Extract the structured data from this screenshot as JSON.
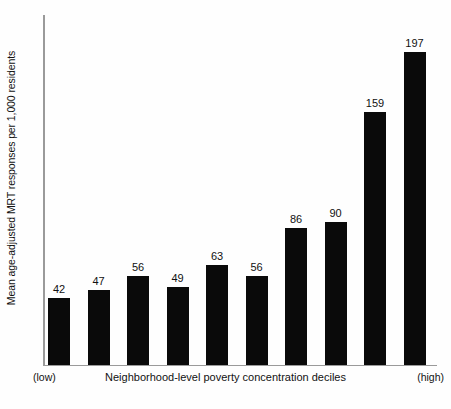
{
  "chart_data": {
    "type": "bar",
    "title": "",
    "subtitle": "",
    "categories": [
      "1",
      "2",
      "3",
      "4",
      "5",
      "6",
      "7",
      "8",
      "9",
      "10"
    ],
    "values": [
      42,
      47,
      56,
      49,
      63,
      56,
      86,
      90,
      159,
      197
    ],
    "data_labels": [
      "42",
      "47",
      "56",
      "49",
      "63",
      "56",
      "86",
      "90",
      "159",
      "197"
    ],
    "xlabel": "Neighborhood-level poverty concentration deciles",
    "ylabel": "Mean age-adjusted MRT responses per 1,000 residents",
    "xlim_labels": {
      "left": "(low)",
      "right": "(high)"
    },
    "ylim": [
      0,
      220
    ],
    "grid": false,
    "legend": null,
    "tick_labels_x": [],
    "tick_labels_y": [],
    "bar_color": "#0a0a0a",
    "axis_color": "#9a9a9a",
    "background_color": "#fefefe"
  },
  "axes": {
    "y_title": "Mean age-adjusted MRT responses per 1,000 residents",
    "x_title": "Neighborhood-level poverty concentration deciles",
    "x_low_caption": "(low)",
    "x_high_caption": "(high)"
  }
}
